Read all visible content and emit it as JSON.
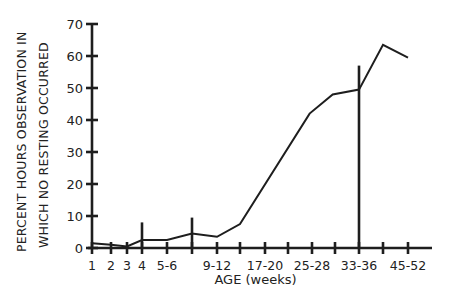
{
  "chart_data": {
    "type": "line",
    "title": "",
    "xlabel": "AGE (weeks)",
    "ylabel": [
      "PERCENT HOURS OBSERVATION IN",
      "WHICH NO RESTING OCCURRED"
    ],
    "ylim": [
      0,
      70
    ],
    "yticks": [
      0,
      10,
      20,
      30,
      40,
      50,
      60,
      70
    ],
    "grid": false,
    "legend": null,
    "xtick_labels": [
      {
        "label": "1",
        "pos": 0
      },
      {
        "label": "2",
        "pos": 1
      },
      {
        "label": "3",
        "pos": 2
      },
      {
        "label": "4",
        "pos": 3
      },
      {
        "label": "5-6",
        "pos": 4
      },
      {
        "label": "9-12",
        "pos": 6
      },
      {
        "label": "17-20",
        "pos": 8
      },
      {
        "label": "25-28",
        "pos": 10
      },
      {
        "label": "33-36",
        "pos": 12
      },
      {
        "label": "45-52",
        "pos": 14
      }
    ],
    "x_positions": 15,
    "series": [
      {
        "name": "Percent hours with no resting",
        "points": [
          {
            "pos": 0,
            "value": 1.5
          },
          {
            "pos": 1,
            "value": 1.0
          },
          {
            "pos": 2,
            "value": 0.5
          },
          {
            "pos": 3,
            "value": 2.5
          },
          {
            "pos": 4,
            "value": 2.5
          },
          {
            "pos": 5,
            "value": 4.5
          },
          {
            "pos": 6,
            "value": 3.5
          },
          {
            "pos": 7,
            "value": 7.5
          },
          {
            "pos": 9.9,
            "value": 42
          },
          {
            "pos": 10.9,
            "value": 48
          },
          {
            "pos": 12,
            "value": 49.5
          },
          {
            "pos": 13,
            "value": 63.5
          },
          {
            "pos": 14,
            "value": 59.5
          }
        ]
      }
    ],
    "error_bars": [
      {
        "pos": 3,
        "low": 0,
        "high": 8
      },
      {
        "pos": 5,
        "low": 0,
        "high": 9.5
      },
      {
        "pos": 12,
        "low": 0,
        "high": 57
      }
    ]
  }
}
